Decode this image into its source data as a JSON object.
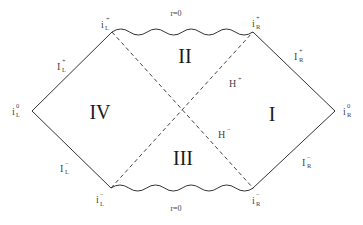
{
  "diagram": {
    "type": "penrose-diagram",
    "colors": {
      "line": "#333333",
      "text": "#2a2a2a",
      "background": "#ffffff"
    },
    "vertices": {
      "left": {
        "x": 32,
        "y": 111
      },
      "right": {
        "x": 335,
        "y": 111
      },
      "top_left": {
        "x": 112,
        "y": 32
      },
      "top_right": {
        "x": 253,
        "y": 32
      },
      "bottom_left": {
        "x": 111,
        "y": 188
      },
      "bottom_right": {
        "x": 253,
        "y": 188
      }
    },
    "regions": {
      "I": "I",
      "II": "II",
      "III": "III",
      "IV": "IV"
    },
    "horizons": {
      "future": {
        "base": "H",
        "sup": "+"
      },
      "past": {
        "base": "H",
        "sup": "−"
      }
    },
    "singularities": {
      "top": "r=0",
      "bottom": "r=0"
    },
    "points": {
      "i_L_plus": {
        "base": "i",
        "sup": "+",
        "sub": "L"
      },
      "i_R_plus": {
        "base": "i",
        "sup": "+",
        "sub": "R"
      },
      "i_L_minus": {
        "base": "i",
        "sup": "−",
        "sub": "L"
      },
      "i_R_minus": {
        "base": "i",
        "sup": "−",
        "sub": "R"
      },
      "i_L_zero": {
        "base": "i",
        "sup": "0",
        "sub": "L"
      },
      "i_R_zero": {
        "base": "i",
        "sup": "0",
        "sub": "R"
      }
    },
    "null_infinity": {
      "I_L_plus": {
        "base": "I",
        "sup": "+",
        "sub": "L"
      },
      "I_R_plus": {
        "base": "I",
        "sup": "+",
        "sub": "R"
      },
      "I_L_minus": {
        "base": "I",
        "sup": "−",
        "sub": "L"
      },
      "I_R_minus": {
        "base": "I",
        "sup": "−",
        "sub": "R"
      }
    }
  }
}
